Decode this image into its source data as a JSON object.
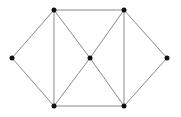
{
  "diagram": {
    "type": "undirected-graph",
    "width": 181,
    "height": 117,
    "colors": {
      "edge": "#8a8a8a",
      "node": "#111111",
      "background": "#ffffff"
    },
    "nodes": [
      {
        "id": "L",
        "x": 12,
        "y": 58
      },
      {
        "id": "TL",
        "x": 54,
        "y": 10
      },
      {
        "id": "TR",
        "x": 124,
        "y": 10
      },
      {
        "id": "C",
        "x": 90,
        "y": 58
      },
      {
        "id": "R",
        "x": 167,
        "y": 58
      },
      {
        "id": "BL",
        "x": 54,
        "y": 106
      },
      {
        "id": "BR",
        "x": 124,
        "y": 106
      }
    ],
    "edges": [
      [
        "L",
        "TL"
      ],
      [
        "L",
        "BL"
      ],
      [
        "TL",
        "TR"
      ],
      [
        "TL",
        "BL"
      ],
      [
        "TL",
        "C"
      ],
      [
        "TR",
        "C"
      ],
      [
        "TR",
        "BR"
      ],
      [
        "TR",
        "R"
      ],
      [
        "BL",
        "C"
      ],
      [
        "BL",
        "BR"
      ],
      [
        "C",
        "BR"
      ],
      [
        "R",
        "BR"
      ]
    ]
  }
}
